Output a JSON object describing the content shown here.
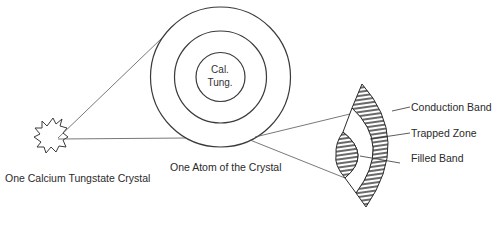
{
  "diagram": {
    "crystal_label": "One Calcium Tungstate Crystal",
    "atom_label": "One Atom of the Crystal",
    "nucleus_label_line1": "Cal.",
    "nucleus_label_line2": "Tung.",
    "band_labels": {
      "conduction": "Conduction Band",
      "trapped": "Trapped Zone",
      "filled": "Filled Band"
    }
  },
  "colors": {
    "stroke": "#3a3a3a",
    "text": "#2a2a2a",
    "background": "#ffffff"
  }
}
